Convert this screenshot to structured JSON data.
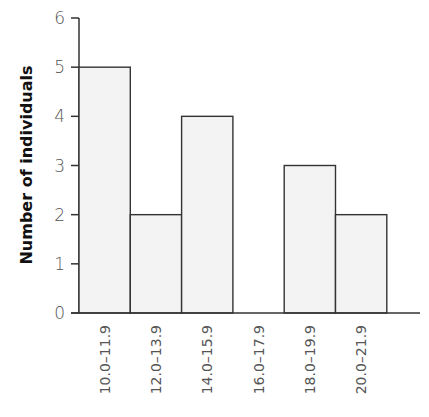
{
  "chart_data": {
    "type": "bar",
    "subtype": "histogram",
    "title": "",
    "xlabel": "",
    "ylabel": "Number of individuals",
    "categories": [
      "10.0–11.9",
      "12.0–13.9",
      "14.0–15.9",
      "16.0–17.9",
      "18.0–19.9",
      "20.0–21.9"
    ],
    "values": [
      5,
      2,
      4,
      0,
      3,
      2
    ],
    "ylim": [
      0,
      6
    ],
    "yticks": [
      0,
      1,
      2,
      3,
      4,
      5,
      6
    ],
    "grid": false,
    "legend": null,
    "colors": {
      "bar_fill": "#f3f3f3",
      "bar_stroke": "#333333",
      "axis": "#333333"
    }
  }
}
